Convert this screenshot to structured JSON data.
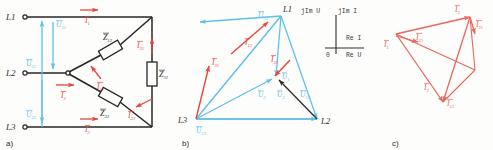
{
  "figure": {
    "background": "#fdfdfc",
    "colors": {
      "wire_black": "#262626",
      "voltage_blue": "#5fc2e8",
      "current_red": "#e8453c",
      "label_black": "#2e2e2e",
      "panel_c_red": "#e8675e"
    }
  },
  "panels": [
    {
      "id": "a",
      "caption": "a)",
      "kind": "circuit-schematic"
    },
    {
      "id": "b",
      "caption": "b)",
      "kind": "phasor-diagram-voltage"
    },
    {
      "id": "c",
      "caption": "c)",
      "kind": "phasor-diagram-current"
    }
  ],
  "panel_a": {
    "terminals": [
      {
        "name": "L1",
        "label": "L1"
      },
      {
        "name": "L2",
        "label": "L2"
      },
      {
        "name": "L3",
        "label": "L3"
      }
    ],
    "voltages": [
      {
        "name": "U31",
        "base": "U",
        "sub": "31"
      },
      {
        "name": "U12",
        "base": "U",
        "sub": "12"
      },
      {
        "name": "U23",
        "base": "U",
        "sub": "23"
      }
    ],
    "line_currents": [
      {
        "name": "I1",
        "base": "I",
        "sub": "1"
      },
      {
        "name": "I2",
        "base": "I",
        "sub": "2"
      },
      {
        "name": "I3",
        "base": "I",
        "sub": "3"
      }
    ],
    "phase_currents": [
      {
        "name": "I12",
        "base": "I",
        "sub": "12"
      },
      {
        "name": "I23",
        "base": "I",
        "sub": "23"
      },
      {
        "name": "I31",
        "base": "I",
        "sub": "31"
      }
    ],
    "impedances": [
      {
        "name": "Z12",
        "base": "Z",
        "sub": "12"
      },
      {
        "name": "Z23",
        "base": "Z",
        "sub": "23"
      },
      {
        "name": "Z31",
        "base": "Z",
        "sub": "31"
      }
    ]
  },
  "panel_b": {
    "vertices": [
      {
        "name": "L1",
        "label": "L1"
      },
      {
        "name": "L2",
        "label": "L2"
      },
      {
        "name": "L3",
        "label": "L3"
      }
    ],
    "line_voltages": [
      {
        "name": "U31",
        "base": "U",
        "sub": "31"
      },
      {
        "name": "U12",
        "base": "U",
        "sub": "12"
      },
      {
        "name": "U23",
        "base": "U",
        "sub": "23"
      }
    ],
    "phase_voltages": [
      {
        "name": "U1",
        "base": "U",
        "sub": "1"
      },
      {
        "name": "U2",
        "base": "U",
        "sub": "2"
      },
      {
        "name": "U3",
        "base": "U",
        "sub": "3"
      }
    ],
    "currents": [
      {
        "name": "I12",
        "base": "I",
        "sub": "12"
      },
      {
        "name": "I23",
        "base": "I",
        "sub": "23"
      },
      {
        "name": "I31",
        "base": "I",
        "sub": "31"
      }
    ],
    "axis_inset": {
      "im_voltage": "jIm U",
      "im_current": "jIm I",
      "re_current": "Re I",
      "re_voltage": "Re U",
      "origin": "0"
    }
  },
  "panel_c": {
    "currents": [
      {
        "name": "I1",
        "base": "I",
        "sub": "1"
      },
      {
        "name": "I2",
        "base": "I",
        "sub": "2"
      },
      {
        "name": "I3",
        "base": "I",
        "sub": "3"
      },
      {
        "name": "I12",
        "base": "I",
        "sub": "12"
      },
      {
        "name": "I23",
        "base": "I",
        "sub": "23"
      },
      {
        "name": "I31",
        "base": "I",
        "sub": "31"
      }
    ]
  }
}
